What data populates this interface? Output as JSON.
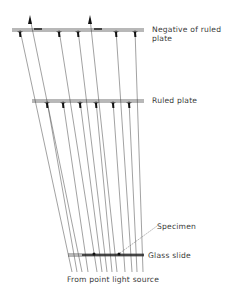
{
  "labels": {
    "negative": "Negative of ruled plate",
    "negative_line1": "Negative of ruled",
    "negative_line2": "plate",
    "ruled_plate": "Ruled plate",
    "specimen": "Specimen",
    "glass_slide": "Glass slide",
    "source": "From point light source"
  },
  "colors": {
    "line": "#555555",
    "mark": "#111111",
    "text": "#3a3a3a"
  },
  "geometry": {
    "negative_plate_y": 30,
    "ruled_plate_y": 101,
    "glass_slide_y": 255,
    "bottom_y": 272,
    "negative_marks_x": [
      20,
      59,
      78,
      116,
      135
    ],
    "negative_arrows_x": [
      30,
      90
    ],
    "ruled_marks_x": [
      47,
      63,
      80,
      96,
      113,
      129
    ],
    "specimen_dots_x": [
      94,
      119
    ]
  }
}
